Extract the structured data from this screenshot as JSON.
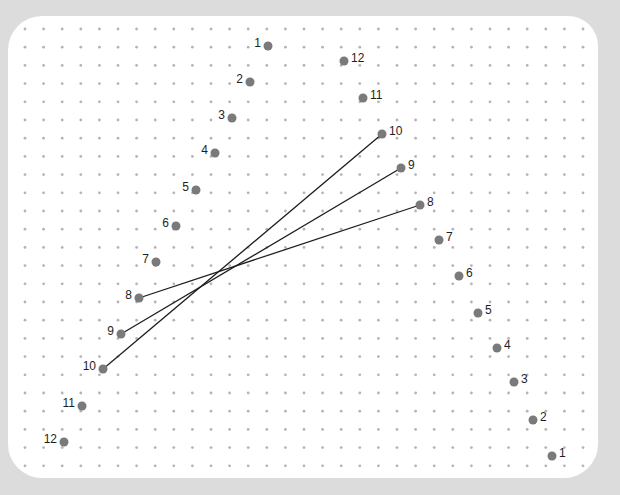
{
  "puzzle": {
    "type": "dot-to-dot",
    "colors": {
      "background": "#dcdcdc",
      "card": "#ffffff",
      "grid_dot": "#b4b4b4",
      "point": "#7a7a7a",
      "line": "#1e1e1e"
    },
    "grid": {
      "x0": 25,
      "y0": 29,
      "dx": 18.6,
      "dy": 18.2,
      "cols": 31,
      "rows": 25
    },
    "left_series": [
      {
        "label": "1",
        "x": 268,
        "y": 46,
        "label_side": "left"
      },
      {
        "label": "2",
        "x": 250,
        "y": 82,
        "label_side": "left"
      },
      {
        "label": "3",
        "x": 232,
        "y": 118,
        "label_side": "left"
      },
      {
        "label": "4",
        "x": 215,
        "y": 153,
        "label_side": "left"
      },
      {
        "label": "5",
        "x": 196,
        "y": 190,
        "label_side": "left"
      },
      {
        "label": "6",
        "x": 176,
        "y": 226,
        "label_side": "left"
      },
      {
        "label": "7",
        "x": 156,
        "y": 262,
        "label_side": "left"
      },
      {
        "label": "8",
        "x": 139,
        "y": 298,
        "label_side": "left"
      },
      {
        "label": "9",
        "x": 121,
        "y": 334,
        "label_side": "left"
      },
      {
        "label": "10",
        "x": 103,
        "y": 369,
        "label_side": "left"
      },
      {
        "label": "11",
        "x": 82,
        "y": 406,
        "label_side": "left"
      },
      {
        "label": "12",
        "x": 64,
        "y": 442,
        "label_side": "left"
      }
    ],
    "right_series": [
      {
        "label": "12",
        "x": 344,
        "y": 61,
        "label_side": "right"
      },
      {
        "label": "11",
        "x": 363,
        "y": 98,
        "label_side": "right"
      },
      {
        "label": "10",
        "x": 382,
        "y": 134,
        "label_side": "right"
      },
      {
        "label": "9",
        "x": 401,
        "y": 168,
        "label_side": "right"
      },
      {
        "label": "8",
        "x": 420,
        "y": 205,
        "label_side": "right"
      },
      {
        "label": "7",
        "x": 439,
        "y": 240,
        "label_side": "right"
      },
      {
        "label": "6",
        "x": 459,
        "y": 276,
        "label_side": "right"
      },
      {
        "label": "5",
        "x": 478,
        "y": 313,
        "label_side": "right"
      },
      {
        "label": "4",
        "x": 497,
        "y": 348,
        "label_side": "right"
      },
      {
        "label": "3",
        "x": 514,
        "y": 382,
        "label_side": "right"
      },
      {
        "label": "2",
        "x": 533,
        "y": 420,
        "label_side": "right"
      },
      {
        "label": "1",
        "x": 552,
        "y": 456,
        "label_side": "right"
      }
    ],
    "connections": [
      {
        "from": "left:8",
        "to": "right:8"
      },
      {
        "from": "left:9",
        "to": "right:9"
      },
      {
        "from": "left:10",
        "to": "right:10"
      }
    ]
  }
}
